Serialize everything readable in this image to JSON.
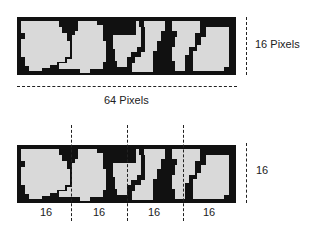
{
  "top_figure": {
    "width_label": "64 Pixels",
    "height_label": "16 Pixels"
  },
  "bottom_figure": {
    "height_label": "16",
    "segment_labels": [
      "16",
      "16",
      "16",
      "16"
    ],
    "divider_count": 3
  },
  "colors": {
    "fill": "#d9d9d9",
    "outline": "#111111",
    "dash": "#222222"
  }
}
